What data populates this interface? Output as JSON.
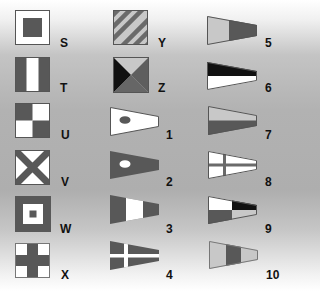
{
  "colors": {
    "dark": "#585858",
    "black": "#111111",
    "light": "#c8c8c8",
    "white": "#ffffff",
    "outline": "#555555"
  },
  "columns": [
    {
      "flags": [
        {
          "label": "S",
          "icon": "flag-s-icon",
          "description": "white square with dark square center"
        },
        {
          "label": "T",
          "icon": "flag-t-icon",
          "description": "vertical tricolor dark-white-dark"
        },
        {
          "label": "U",
          "icon": "flag-u-icon",
          "description": "checkered quarters dark-white-white-dark"
        },
        {
          "label": "V",
          "icon": "flag-v-icon",
          "description": "white with dark diagonal cross"
        },
        {
          "label": "W",
          "icon": "flag-w-icon",
          "description": "dark border, white square, dark center"
        },
        {
          "label": "X",
          "icon": "flag-x-icon",
          "description": "white with dark upright cross"
        }
      ]
    },
    {
      "flags": [
        {
          "label": "Y",
          "icon": "flag-y-icon",
          "description": "diagonal stripes dark and light"
        },
        {
          "label": "Z",
          "icon": "flag-z-icon",
          "description": "four triangles light-black-dark-dark"
        },
        {
          "label": "1",
          "icon": "pennant-1-icon",
          "description": "white pennant with dark disc"
        },
        {
          "label": "2",
          "icon": "pennant-2-icon",
          "description": "dark pennant with white disc"
        },
        {
          "label": "3",
          "icon": "pennant-3-icon",
          "description": "dark-white-dark vertical bands"
        },
        {
          "label": "4",
          "icon": "pennant-4-icon",
          "description": "dark pennant with white cross"
        }
      ]
    },
    {
      "flags": [
        {
          "label": "5",
          "icon": "pennant-5-icon",
          "description": "light hoist, dark fly"
        },
        {
          "label": "6",
          "icon": "pennant-6-icon",
          "description": "black over white horizontal halves"
        },
        {
          "label": "7",
          "icon": "pennant-7-icon",
          "description": "light over dark horizontal halves"
        },
        {
          "label": "8",
          "icon": "pennant-8-icon",
          "description": "white pennant with dark cross"
        },
        {
          "label": "9",
          "icon": "pennant-9-icon",
          "description": "quartered white-black-dark-light"
        },
        {
          "label": "10",
          "icon": "pennant-10-icon",
          "description": "light-dark-light vertical bands"
        }
      ]
    }
  ]
}
